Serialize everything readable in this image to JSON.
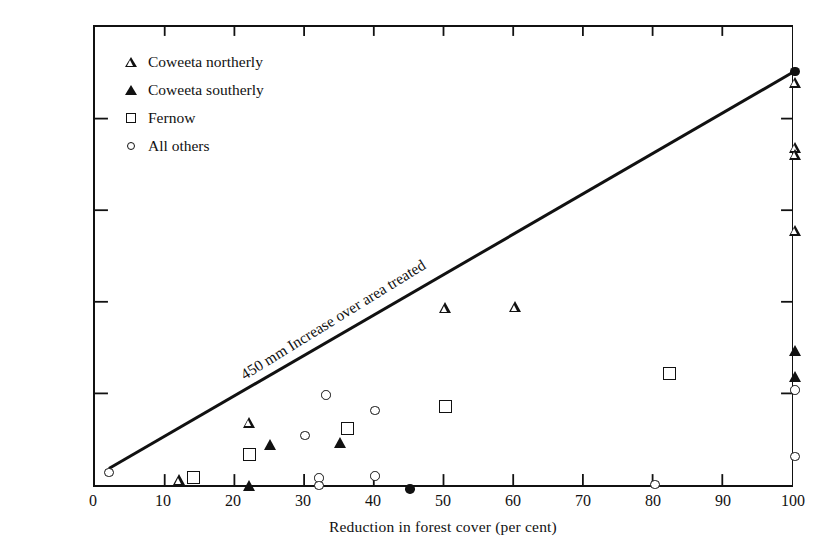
{
  "chart_data": {
    "type": "scatter",
    "title": "",
    "xlabel": "Reduction in forest cover (per cent)",
    "ylabel": "First year streamflow increases after treatment (mm)",
    "xlim": [
      0,
      100
    ],
    "ylim": [
      0,
      500
    ],
    "xticks": [
      0,
      10,
      20,
      30,
      40,
      50,
      60,
      70,
      80,
      90,
      100
    ],
    "yticks": [
      0,
      100,
      200,
      300,
      400,
      500
    ],
    "grid": false,
    "legend_position": "upper left",
    "annotations": [
      {
        "text": "450 mm  Increase over area treated",
        "x": 22,
        "y": 130,
        "rotation": -31.7
      }
    ],
    "reference_line": {
      "label": "450 mm Increase over area treated",
      "x": [
        2,
        100
      ],
      "y": [
        18,
        450
      ]
    },
    "series": [
      {
        "name": "Coweeta northerly",
        "marker": "triangle-open",
        "points": [
          {
            "x": 12,
            "y": 10
          },
          {
            "x": 22,
            "y": 72
          },
          {
            "x": 50,
            "y": 196
          },
          {
            "x": 60,
            "y": 197
          },
          {
            "x": 100,
            "y": 440
          },
          {
            "x": 100,
            "y": 370
          },
          {
            "x": 100,
            "y": 362
          },
          {
            "x": 100,
            "y": 280
          }
        ]
      },
      {
        "name": "Coweeta southerly",
        "marker": "triangle-filled",
        "points": [
          {
            "x": 22,
            "y": 4
          },
          {
            "x": 25,
            "y": 48
          },
          {
            "x": 35,
            "y": 50
          },
          {
            "x": 100,
            "y": 150
          },
          {
            "x": 100,
            "y": 122
          }
        ]
      },
      {
        "name": "Fernow",
        "marker": "square-open",
        "points": [
          {
            "x": 14,
            "y": 12
          },
          {
            "x": 22,
            "y": 37
          },
          {
            "x": 36,
            "y": 65
          },
          {
            "x": 50,
            "y": 89
          },
          {
            "x": 82,
            "y": 125
          }
        ]
      },
      {
        "name": "All others",
        "marker": "circle-open",
        "points": [
          {
            "x": 2,
            "y": 18
          },
          {
            "x": 30,
            "y": 58
          },
          {
            "x": 32,
            "y": 12
          },
          {
            "x": 32,
            "y": 4
          },
          {
            "x": 33,
            "y": 102
          },
          {
            "x": 40,
            "y": 85
          },
          {
            "x": 40,
            "y": 14
          },
          {
            "x": 80,
            "y": 5
          },
          {
            "x": 100,
            "y": 107
          },
          {
            "x": 100,
            "y": 35
          }
        ]
      },
      {
        "name": "All others filled",
        "marker": "circle-filled",
        "points": [
          {
            "x": 45,
            "y": 0
          },
          {
            "x": 100,
            "y": 452
          }
        ]
      }
    ],
    "legend": [
      {
        "label": "Coweeta northerly",
        "marker": "triangle-open"
      },
      {
        "label": "Coweeta southerly",
        "marker": "triangle-filled"
      },
      {
        "label": "Fernow",
        "marker": "square-open"
      },
      {
        "label": "All others",
        "marker": "circle-open"
      }
    ]
  },
  "colors": {
    "ink": "#111111",
    "background": "#ffffff"
  }
}
